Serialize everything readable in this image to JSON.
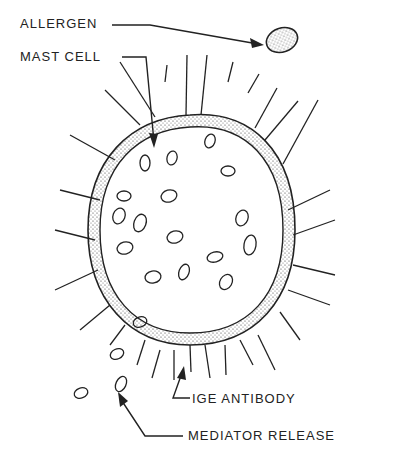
{
  "diagram": {
    "labels": {
      "allergen": "ALLERGEN",
      "mast_cell": "MAST CELL",
      "ige_antibody": "IGE ANTIBODY",
      "mediator_release": "MEDIATOR RELEASE"
    },
    "colors": {
      "ink": "#222222",
      "background": "#ffffff"
    }
  }
}
